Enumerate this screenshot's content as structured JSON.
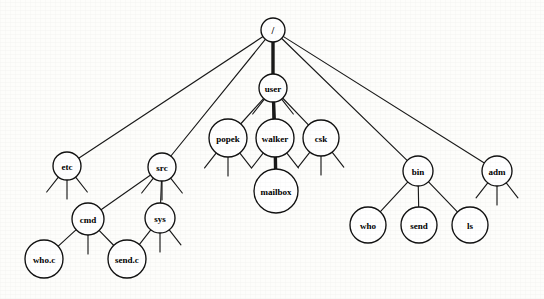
{
  "diagram": {
    "type": "tree",
    "width": 544,
    "height": 299,
    "background_color": "#fdfdfb",
    "line_color": "#1a1a1a",
    "node_fill": "#ffffff",
    "highlight_path_label": "/user/walker/mailbox",
    "nodes": [
      {
        "id": "root",
        "label": "/",
        "x": 273,
        "y": 30,
        "r": 12,
        "font_size": 10,
        "stubs": "none"
      },
      {
        "id": "user",
        "label": "user",
        "x": 273,
        "y": 88,
        "r": 14,
        "font_size": 9,
        "stubs": "three"
      },
      {
        "id": "popek",
        "label": "popek",
        "x": 228,
        "y": 138,
        "r": 19,
        "font_size": 9,
        "stubs": "three"
      },
      {
        "id": "walker",
        "label": "walker",
        "x": 275,
        "y": 138,
        "r": 19,
        "font_size": 9,
        "stubs": "two"
      },
      {
        "id": "csk",
        "label": "csk",
        "x": 321,
        "y": 138,
        "r": 18,
        "font_size": 9,
        "stubs": "three"
      },
      {
        "id": "mailbox",
        "label": "mailbox",
        "x": 276,
        "y": 191,
        "r": 22,
        "font_size": 9,
        "stubs": "none"
      },
      {
        "id": "etc",
        "label": "etc",
        "x": 67,
        "y": 166,
        "r": 14,
        "font_size": 9,
        "stubs": "three"
      },
      {
        "id": "src",
        "label": "src",
        "x": 162,
        "y": 167,
        "r": 14,
        "font_size": 9,
        "stubs": "three"
      },
      {
        "id": "cmd",
        "label": "cmd",
        "x": 88,
        "y": 219,
        "r": 16,
        "font_size": 9,
        "stubs": "center"
      },
      {
        "id": "sys",
        "label": "sys",
        "x": 160,
        "y": 218,
        "r": 15,
        "font_size": 9,
        "stubs": "three"
      },
      {
        "id": "whoc",
        "label": "who.c",
        "x": 44,
        "y": 259,
        "r": 19,
        "font_size": 9,
        "stubs": "none"
      },
      {
        "id": "sendc",
        "label": "send.c",
        "x": 127,
        "y": 259,
        "r": 19,
        "font_size": 9,
        "stubs": "none"
      },
      {
        "id": "bin",
        "label": "bin",
        "x": 418,
        "y": 171,
        "r": 15,
        "font_size": 9,
        "stubs": "none"
      },
      {
        "id": "adm",
        "label": "adm",
        "x": 497,
        "y": 171,
        "r": 15,
        "font_size": 9,
        "stubs": "three"
      },
      {
        "id": "who",
        "label": "who",
        "x": 368,
        "y": 225,
        "r": 18,
        "font_size": 9,
        "stubs": "none"
      },
      {
        "id": "send",
        "label": "send",
        "x": 419,
        "y": 225,
        "r": 18,
        "font_size": 9,
        "stubs": "none"
      },
      {
        "id": "ls",
        "label": "ls",
        "x": 470,
        "y": 225,
        "r": 18,
        "font_size": 9,
        "stubs": "none"
      }
    ],
    "edges": [
      {
        "from": "root",
        "to": "etc",
        "weight": "thin"
      },
      {
        "from": "root",
        "to": "src",
        "weight": "thin"
      },
      {
        "from": "root",
        "to": "user",
        "weight": "thick"
      },
      {
        "from": "root",
        "to": "bin",
        "weight": "thin"
      },
      {
        "from": "root",
        "to": "adm",
        "weight": "thin"
      },
      {
        "from": "user",
        "to": "popek",
        "weight": "thin"
      },
      {
        "from": "user",
        "to": "walker",
        "weight": "thick"
      },
      {
        "from": "user",
        "to": "csk",
        "weight": "thin"
      },
      {
        "from": "walker",
        "to": "mailbox",
        "weight": "thick"
      },
      {
        "from": "src",
        "to": "cmd",
        "weight": "thin"
      },
      {
        "from": "src",
        "to": "sys",
        "weight": "thin"
      },
      {
        "from": "cmd",
        "to": "whoc",
        "weight": "thin"
      },
      {
        "from": "cmd",
        "to": "sendc",
        "weight": "thin"
      },
      {
        "from": "bin",
        "to": "who",
        "weight": "thin"
      },
      {
        "from": "bin",
        "to": "send",
        "weight": "thin"
      },
      {
        "from": "bin",
        "to": "ls",
        "weight": "thin"
      }
    ],
    "stub_geometry": {
      "length": 19,
      "spread_degrees": 38,
      "note": "short broom marks under a node indicate unshown children"
    }
  }
}
